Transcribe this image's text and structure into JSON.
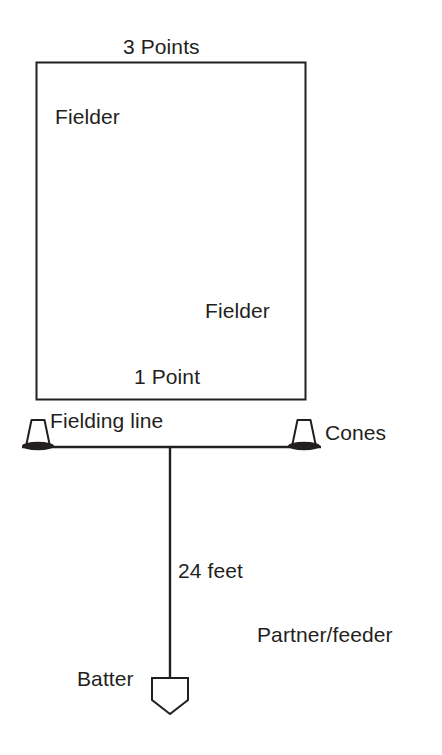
{
  "diagram": {
    "colors": {
      "stroke": "#231f20",
      "text": "#231f20",
      "background": "#ffffff"
    },
    "labels": {
      "three_points": "3 Points",
      "fielder_top": "Fielder",
      "fielder_bottom": "Fielder",
      "one_point": "1 Point",
      "fielding_line": "Fielding line",
      "cones": "Cones",
      "distance": "24 feet",
      "partner_feeder": "Partner/feeder",
      "batter": "Batter"
    },
    "shapes": {
      "scoring_zone": {
        "name": "scoring-rectangle",
        "x": 36,
        "y": 62,
        "width": 270,
        "height": 338
      },
      "fielding_line": {
        "name": "fielding-line",
        "x1": 22,
        "y1": 447,
        "x2": 321,
        "y2": 447
      },
      "distance_line": {
        "name": "distance-line",
        "x1": 170,
        "y1": 447,
        "x2": 170,
        "y2": 678
      },
      "cone_left": {
        "name": "cone-left",
        "cx": 38,
        "cy": 447
      },
      "cone_right": {
        "name": "cone-right",
        "cx": 304,
        "cy": 447
      },
      "home_plate": {
        "name": "home-plate",
        "cx": 170,
        "cy": 694
      }
    }
  }
}
